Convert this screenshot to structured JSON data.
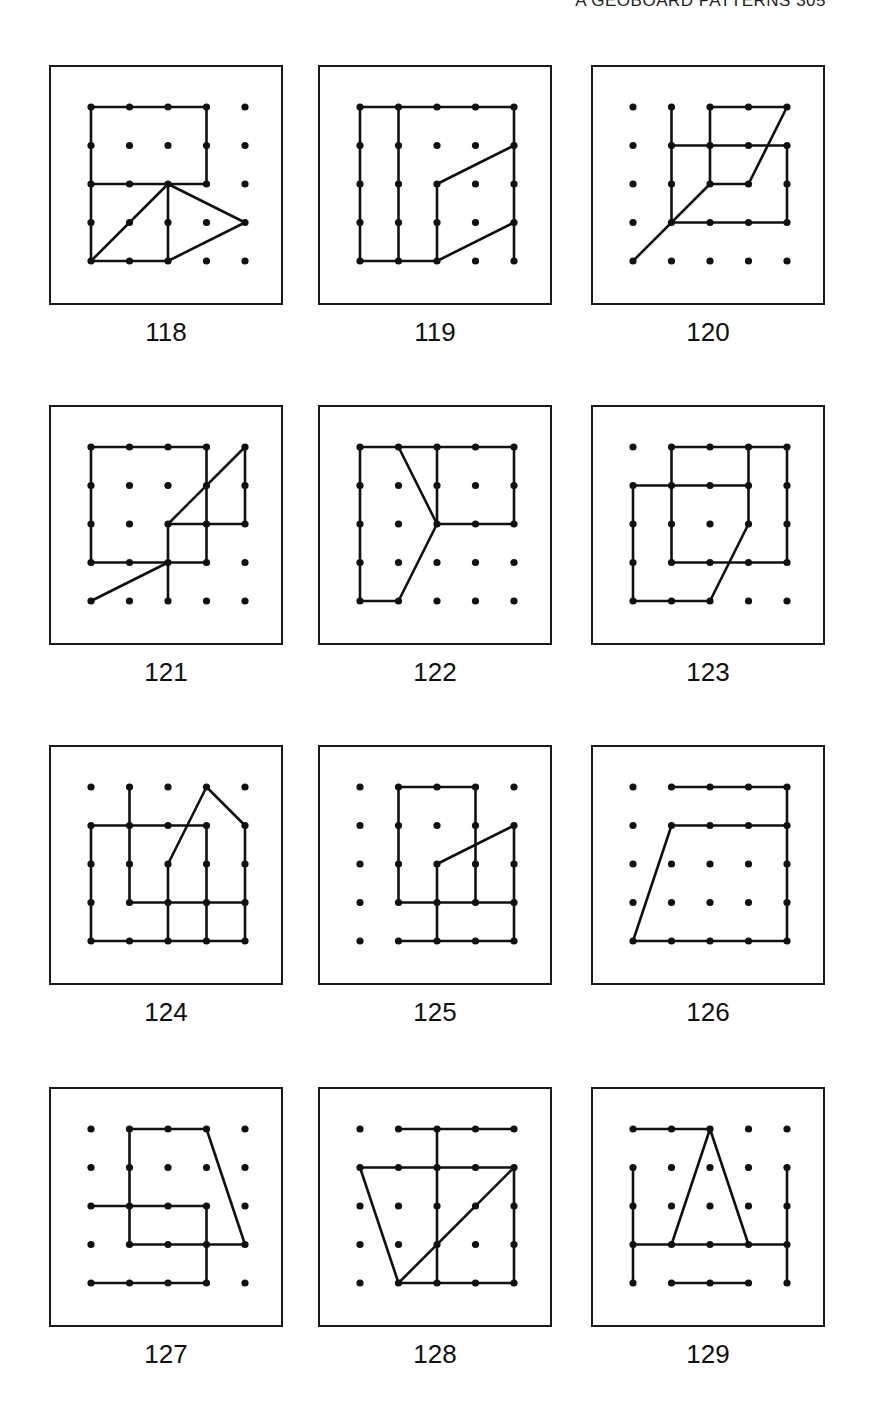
{
  "page": {
    "running_head": "A GEOBOARD PATTERNS 305"
  },
  "grid": {
    "cols": 5,
    "rows": 5,
    "ink_color": "#111111",
    "background": "#ffffff"
  },
  "patterns": [
    {
      "number": "118",
      "lines": [
        [
          [
            0,
            0
          ],
          [
            3,
            0
          ],
          [
            3,
            2
          ],
          [
            0,
            2
          ],
          [
            0,
            0
          ]
        ],
        [
          [
            0,
            2
          ],
          [
            0,
            4
          ],
          [
            2,
            4
          ]
        ],
        [
          [
            0,
            4
          ],
          [
            2,
            2
          ]
        ],
        [
          [
            2,
            2
          ],
          [
            2,
            4
          ]
        ],
        [
          [
            2,
            2
          ],
          [
            4,
            3
          ],
          [
            2,
            4
          ]
        ]
      ]
    },
    {
      "number": "119",
      "lines": [
        [
          [
            0,
            0
          ],
          [
            4,
            0
          ]
        ],
        [
          [
            0,
            0
          ],
          [
            0,
            4
          ],
          [
            2,
            4
          ]
        ],
        [
          [
            1,
            0
          ],
          [
            1,
            4
          ]
        ],
        [
          [
            4,
            0
          ],
          [
            4,
            4
          ]
        ],
        [
          [
            2,
            4
          ],
          [
            2,
            2
          ],
          [
            4,
            1
          ]
        ],
        [
          [
            2,
            4
          ],
          [
            4,
            3
          ]
        ]
      ]
    },
    {
      "number": "120",
      "lines": [
        [
          [
            1,
            0
          ],
          [
            1,
            3
          ]
        ],
        [
          [
            1,
            1
          ],
          [
            4,
            1
          ],
          [
            4,
            3
          ],
          [
            1,
            3
          ]
        ],
        [
          [
            2,
            0
          ],
          [
            4,
            0
          ],
          [
            3,
            2
          ],
          [
            2,
            2
          ],
          [
            2,
            0
          ]
        ],
        [
          [
            0,
            4
          ],
          [
            2,
            2
          ]
        ]
      ]
    },
    {
      "number": "121",
      "lines": [
        [
          [
            0,
            0
          ],
          [
            3,
            0
          ],
          [
            3,
            3
          ],
          [
            0,
            3
          ],
          [
            0,
            0
          ]
        ],
        [
          [
            2,
            2
          ],
          [
            4,
            0
          ],
          [
            4,
            2
          ],
          [
            2,
            2
          ]
        ],
        [
          [
            2,
            2
          ],
          [
            2,
            4
          ]
        ],
        [
          [
            0,
            4
          ],
          [
            2,
            3
          ]
        ]
      ]
    },
    {
      "number": "122",
      "lines": [
        [
          [
            0,
            0
          ],
          [
            4,
            0
          ],
          [
            4,
            2
          ],
          [
            2,
            2
          ]
        ],
        [
          [
            0,
            0
          ],
          [
            0,
            4
          ],
          [
            1,
            4
          ],
          [
            2,
            2
          ],
          [
            1,
            0
          ]
        ],
        [
          [
            2,
            0
          ],
          [
            2,
            2
          ]
        ]
      ]
    },
    {
      "number": "123",
      "lines": [
        [
          [
            1,
            0
          ],
          [
            4,
            0
          ],
          [
            4,
            3
          ],
          [
            1,
            3
          ],
          [
            1,
            0
          ]
        ],
        [
          [
            0,
            1
          ],
          [
            3,
            1
          ],
          [
            3,
            2
          ],
          [
            2,
            4
          ],
          [
            0,
            4
          ],
          [
            0,
            1
          ]
        ],
        [
          [
            3,
            0
          ],
          [
            3,
            1
          ]
        ]
      ]
    },
    {
      "number": "124",
      "lines": [
        [
          [
            1,
            0
          ],
          [
            1,
            3
          ],
          [
            4,
            3
          ]
        ],
        [
          [
            0,
            1
          ],
          [
            3,
            1
          ],
          [
            3,
            4
          ]
        ],
        [
          [
            0,
            1
          ],
          [
            0,
            4
          ],
          [
            4,
            4
          ],
          [
            4,
            1
          ],
          [
            3,
            0
          ],
          [
            2,
            2
          ],
          [
            2,
            4
          ]
        ]
      ]
    },
    {
      "number": "125",
      "lines": [
        [
          [
            1,
            0
          ],
          [
            3,
            0
          ],
          [
            3,
            3
          ]
        ],
        [
          [
            1,
            0
          ],
          [
            1,
            3
          ],
          [
            4,
            3
          ],
          [
            4,
            1
          ],
          [
            2,
            2
          ],
          [
            2,
            4
          ]
        ],
        [
          [
            1,
            4
          ],
          [
            4,
            4
          ],
          [
            4,
            3
          ]
        ]
      ]
    },
    {
      "number": "126",
      "lines": [
        [
          [
            1,
            0
          ],
          [
            4,
            0
          ],
          [
            4,
            4
          ],
          [
            0,
            4
          ],
          [
            1,
            1
          ],
          [
            4,
            1
          ]
        ]
      ]
    },
    {
      "number": "127",
      "lines": [
        [
          [
            1,
            0
          ],
          [
            3,
            0
          ],
          [
            4,
            3
          ],
          [
            1,
            3
          ],
          [
            1,
            0
          ]
        ],
        [
          [
            0,
            2
          ],
          [
            3,
            2
          ],
          [
            3,
            4
          ],
          [
            0,
            4
          ]
        ]
      ]
    },
    {
      "number": "128",
      "lines": [
        [
          [
            1,
            0
          ],
          [
            4,
            0
          ]
        ],
        [
          [
            2,
            0
          ],
          [
            2,
            4
          ]
        ],
        [
          [
            0,
            1
          ],
          [
            4,
            1
          ],
          [
            4,
            4
          ],
          [
            1,
            4
          ],
          [
            0,
            1
          ]
        ],
        [
          [
            1,
            4
          ],
          [
            4,
            1
          ]
        ]
      ]
    },
    {
      "number": "129",
      "lines": [
        [
          [
            0,
            0
          ],
          [
            2,
            0
          ]
        ],
        [
          [
            2,
            0
          ],
          [
            1,
            3
          ]
        ],
        [
          [
            2,
            0
          ],
          [
            3,
            3
          ]
        ],
        [
          [
            0,
            1
          ],
          [
            0,
            4
          ]
        ],
        [
          [
            0,
            3
          ],
          [
            4,
            3
          ]
        ],
        [
          [
            4,
            1
          ],
          [
            4,
            4
          ]
        ],
        [
          [
            1,
            4
          ],
          [
            3,
            4
          ]
        ]
      ]
    }
  ]
}
